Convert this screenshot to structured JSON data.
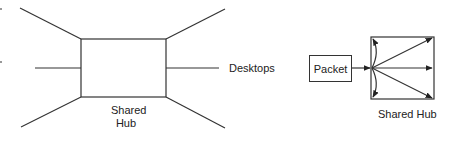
{
  "diagram": {
    "left": {
      "hub_label_line1": "Shared",
      "hub_label_line2": "Hub",
      "desktops_label": "Desktops"
    },
    "right": {
      "packet_label": "Packet",
      "hub_label": "Shared Hub"
    }
  }
}
